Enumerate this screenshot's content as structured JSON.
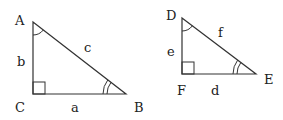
{
  "diagram": {
    "stroke_color": "#333333",
    "triangles": [
      {
        "name": "ABC",
        "vertices": {
          "A": [
            33,
            22
          ],
          "B": [
            126,
            94
          ],
          "C": [
            33,
            94
          ]
        },
        "vertex_labels": {
          "A": "A",
          "B": "B",
          "C": "C"
        },
        "side_labels": {
          "a": "a",
          "b": "b",
          "c": "c"
        },
        "right_angle_at": "C",
        "single_arc_at": "A",
        "double_arc_at": "B"
      },
      {
        "name": "DEF",
        "vertices": {
          "D": [
            182,
            18
          ],
          "E": [
            256,
            74
          ],
          "F": [
            182,
            74
          ]
        },
        "vertex_labels": {
          "D": "D",
          "E": "E",
          "F": "F"
        },
        "side_labels": {
          "d": "d",
          "e": "e",
          "f": "f"
        },
        "right_angle_at": "F",
        "single_arc_at": "D",
        "double_arc_at": "E"
      }
    ]
  }
}
